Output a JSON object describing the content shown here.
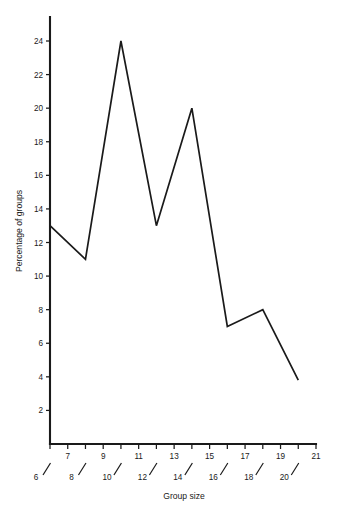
{
  "chart_data": {
    "type": "line",
    "title": "",
    "subtitle": "",
    "xlabel": "Group size",
    "ylabel": "Percentage of groups",
    "x": [
      6,
      8,
      10,
      12,
      14,
      16,
      18,
      20
    ],
    "values": [
      13,
      11,
      24,
      13,
      20,
      7,
      8,
      3.8
    ],
    "series": [
      {
        "name": "Percentage of groups",
        "values": [
          13,
          11,
          24,
          13,
          20,
          7,
          8,
          3.8
        ]
      }
    ],
    "xlim": [
      6,
      21
    ],
    "ylim": [
      0,
      25
    ],
    "x_ticks": [
      6,
      7,
      8,
      9,
      10,
      11,
      12,
      13,
      14,
      15,
      16,
      17,
      18,
      19,
      20,
      21
    ],
    "x_ticks_upper": [
      7,
      9,
      11,
      13,
      15,
      17,
      19,
      21
    ],
    "x_ticks_lower": [
      6,
      8,
      10,
      12,
      14,
      16,
      18,
      20
    ],
    "y_ticks": [
      2,
      4,
      6,
      8,
      10,
      12,
      14,
      16,
      18,
      20,
      22,
      24
    ],
    "grid": false,
    "legend": false,
    "legend_position": "none",
    "line_color": "#1a1a1a",
    "background_color": "#ffffff",
    "annotations": []
  },
  "axes": {
    "y_axis_title": "Percentage of groups",
    "x_axis_title": "Group size",
    "y_tick_labels": [
      "2",
      "4",
      "6",
      "8",
      "10",
      "12",
      "14",
      "16",
      "18",
      "20",
      "22",
      "24"
    ],
    "x_tick_labels_upper": [
      "7",
      "9",
      "11",
      "13",
      "15",
      "17",
      "19",
      "21"
    ],
    "x_tick_labels_lower": [
      "6",
      "8",
      "10",
      "12",
      "14",
      "16",
      "18",
      "20"
    ]
  }
}
